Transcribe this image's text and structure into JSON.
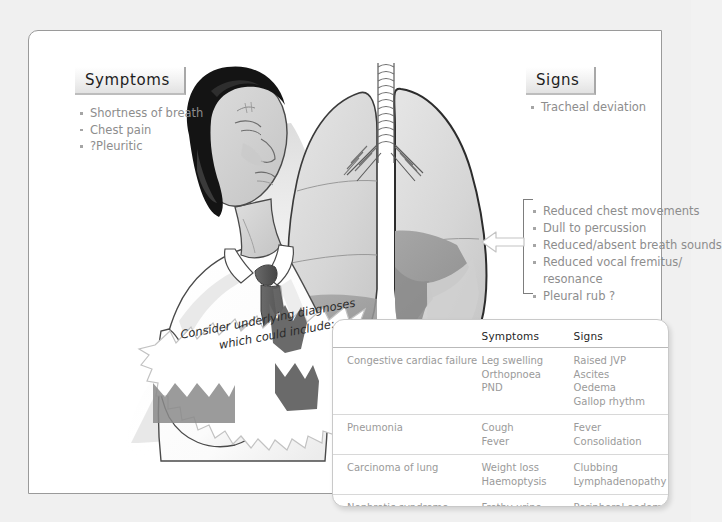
{
  "symptoms_panel": {
    "header": "Symptoms",
    "items": [
      "Shortness of breath",
      "Chest pain",
      "?Pleuritic"
    ]
  },
  "signs_panel": {
    "header": "Signs",
    "items": [
      "Tracheal deviation"
    ]
  },
  "effusion_findings": {
    "items": [
      "Reduced chest movements",
      "Dull to percussion",
      "Reduced/absent breath sounds",
      "Reduced vocal fremitus/",
      "resonance",
      "Pleural rub ?"
    ]
  },
  "callout": {
    "line1": "Consider underlying diagnoses",
    "line2": "which could include:"
  },
  "diagnoses_table": {
    "columns": [
      "",
      "Symptoms",
      "Signs"
    ],
    "rows": [
      {
        "condition": "Congestive cardiac failure",
        "symptoms": [
          "Leg swelling",
          "Orthopnoea",
          "PND"
        ],
        "signs": [
          "Raised JVP",
          "Ascites",
          "Oedema",
          "Gallop rhythm"
        ]
      },
      {
        "condition": "Pneumonia",
        "symptoms": [
          "Cough",
          "Fever"
        ],
        "signs": [
          "Fever",
          "Consolidation"
        ]
      },
      {
        "condition": "Carcinoma of lung",
        "symptoms": [
          "Weight loss",
          "Haemoptysis"
        ],
        "signs": [
          "Clubbing",
          "Lymphadenopathy"
        ]
      },
      {
        "condition": "Nephrotic syndrome",
        "symptoms": [
          "Frothy urine",
          "Leg swelling"
        ],
        "signs": [
          "Peripheral oedema",
          "Proteinuria"
        ]
      }
    ]
  },
  "illustration": {
    "patient_label": "breathless-man-holding-chest",
    "lungs_label": "lungs-with-pleural-effusion",
    "arrow_label": "pointer-arrow-to-effusion",
    "colors": {
      "page_background": "#ffffff",
      "outer_background": "#f0f0f0",
      "lung_fill": "#d8d8d8",
      "effusion_fill": "#9e9e9e",
      "hair": "#141414",
      "tie": "#5a5a5a",
      "skin": "#d2d2d2",
      "shirt": "#ffffff",
      "text_gray": "#9a9a9a",
      "text_dark": "#1f1f1f"
    }
  }
}
